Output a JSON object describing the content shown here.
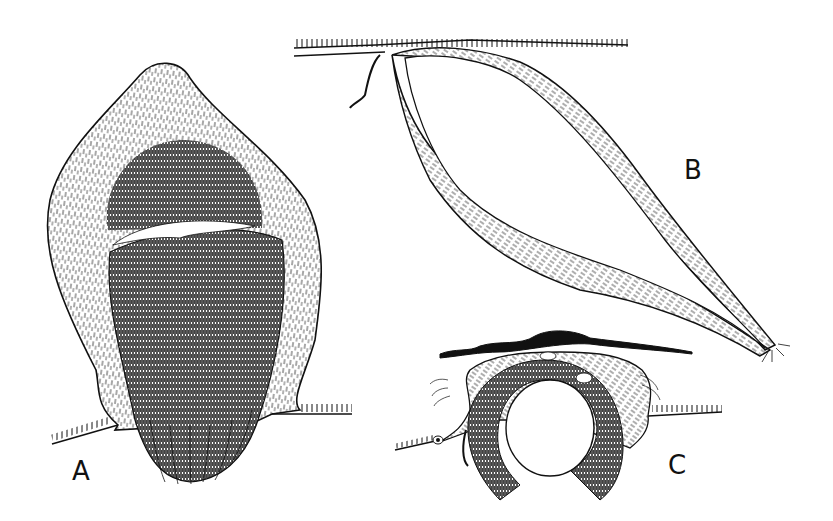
{
  "figure": {
    "panels": [
      {
        "id": "A",
        "label": "A",
        "description": "cross-section of a rounded structure with dense fibrous core and white cleft"
      },
      {
        "id": "B",
        "label": "B",
        "description": "elongated forked fibrous strand hanging from a ciliated surface"
      },
      {
        "id": "C",
        "label": "C",
        "description": "ring-shaped fiber bundle beneath a wavy membrane"
      }
    ],
    "colors": {
      "ink": "#111111",
      "paper": "#ffffff"
    }
  }
}
